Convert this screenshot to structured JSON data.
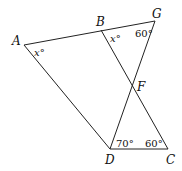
{
  "diagram": {
    "points": {
      "A": {
        "label": "A",
        "x": 24,
        "y": 45
      },
      "B": {
        "label": "B",
        "x": 101,
        "y": 30
      },
      "G": {
        "label": "G",
        "x": 155,
        "y": 21
      },
      "F": {
        "label": "F",
        "x": 133,
        "y": 87
      },
      "D": {
        "label": "D",
        "x": 110,
        "y": 149
      },
      "C": {
        "label": "C",
        "x": 168,
        "y": 149
      }
    },
    "segments": [
      [
        "A",
        "G"
      ],
      [
        "A",
        "D"
      ],
      [
        "D",
        "C"
      ],
      [
        "B",
        "C"
      ],
      [
        "D",
        "G"
      ]
    ],
    "angles": {
      "A": "x°",
      "B": "x°",
      "G": "60°",
      "D": "70°",
      "C": "60°"
    }
  }
}
